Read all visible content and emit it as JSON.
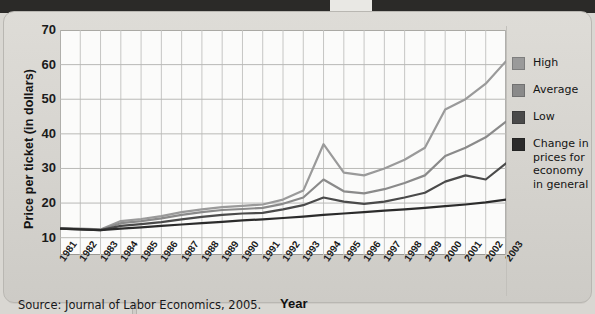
{
  "figure": {
    "source_note": "Source: Journal of Labor Economics, 2005.",
    "yaxis_title": "Price per ticket (in dollars)",
    "xaxis_title": "Year"
  },
  "legend": {
    "items": [
      {
        "label": "High",
        "color": "#9a9a9a"
      },
      {
        "label": "Average",
        "color": "#8a8a8a"
      },
      {
        "label": "Low",
        "color": "#4a4a4a"
      },
      {
        "label": "Change in prices for economy in general",
        "color": "#2b2b2b"
      }
    ]
  },
  "chart_data": {
    "type": "line",
    "title": "",
    "xlabel": "Year",
    "ylabel": "Price per ticket (in dollars)",
    "xlim": [
      1981,
      2003
    ],
    "ylim": [
      5,
      70
    ],
    "yticks": [
      10,
      20,
      30,
      40,
      50,
      60,
      70
    ],
    "grid": true,
    "legend_position": "right",
    "categories": [
      "1981",
      "1982",
      "1983",
      "1984",
      "1985",
      "1986",
      "1987",
      "1988",
      "1989",
      "1990",
      "1991",
      "1992",
      "1993",
      "1994",
      "1995",
      "1996",
      "1997",
      "1998",
      "1999",
      "2000",
      "2001",
      "2002",
      "2003"
    ],
    "series": [
      {
        "name": "High",
        "color": "#9a9a9a",
        "values": [
          12.8,
          12.6,
          12.4,
          14.8,
          15.4,
          16.2,
          17.4,
          18.2,
          18.8,
          19.2,
          19.6,
          21.0,
          23.6,
          37.0,
          28.8,
          28.0,
          30.0,
          32.5,
          36.0,
          47.0,
          50.0,
          54.5,
          61.0
        ]
      },
      {
        "name": "Average",
        "color": "#8a8a8a",
        "values": [
          12.7,
          12.5,
          12.3,
          14.2,
          14.8,
          15.6,
          16.6,
          17.4,
          18.0,
          18.3,
          18.6,
          19.8,
          21.6,
          26.8,
          23.4,
          22.8,
          24.0,
          25.8,
          28.0,
          33.6,
          36.0,
          39.0,
          43.5
        ]
      },
      {
        "name": "Low",
        "color": "#4a4a4a",
        "values": [
          12.6,
          12.4,
          12.2,
          13.4,
          13.9,
          14.5,
          15.3,
          16.0,
          16.6,
          17.0,
          17.2,
          18.2,
          19.4,
          21.6,
          20.4,
          19.8,
          20.4,
          21.6,
          23.0,
          26.2,
          28.0,
          26.8,
          31.5
        ]
      },
      {
        "name": "Change in prices for economy in general",
        "color": "#2b2b2b",
        "values": [
          12.6,
          12.4,
          12.2,
          12.6,
          13.0,
          13.4,
          13.8,
          14.2,
          14.6,
          15.0,
          15.3,
          15.7,
          16.1,
          16.6,
          17.0,
          17.4,
          17.8,
          18.2,
          18.6,
          19.1,
          19.6,
          20.2,
          21.0
        ]
      }
    ]
  }
}
